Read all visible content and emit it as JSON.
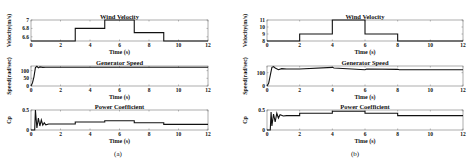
{
  "chart_data": [
    {
      "panel": "(a)",
      "type": "line",
      "subplots": [
        {
          "title": "Wind Velocity",
          "xlabel": "Time (s)",
          "ylabel": "Velocity(m/s)",
          "xlim": [
            0,
            12
          ],
          "ylim": [
            6.5,
            7
          ],
          "yticks": [
            6.6,
            6.8,
            7
          ],
          "xticks": [
            0,
            2,
            4,
            6,
            8,
            10,
            12
          ],
          "x": [
            0,
            3,
            3,
            5,
            5,
            7,
            7,
            9,
            9,
            12
          ],
          "y": [
            6.5,
            6.5,
            6.8,
            6.8,
            7,
            7,
            6.7,
            6.7,
            6.5,
            6.5
          ]
        },
        {
          "title": "Generator Speed",
          "xlabel": "Time (s)",
          "ylabel": "Speed(rad/sec)",
          "xlim": [
            0,
            12
          ],
          "ylim": [
            0,
            130
          ],
          "yticks": [
            0,
            50,
            100
          ],
          "xticks": [
            0,
            2,
            4,
            6,
            8,
            10,
            12
          ],
          "x": [
            0,
            0.1,
            0.2,
            0.3,
            0.4,
            0.5,
            0.6,
            0.8,
            1.0,
            12
          ],
          "y": [
            0,
            20,
            60,
            120,
            128,
            118,
            124,
            121,
            122,
            122
          ]
        },
        {
          "title": "Power Coefficient",
          "xlabel": "Time (s)",
          "ylabel": "Cp",
          "xlim": [
            0,
            12
          ],
          "ylim": [
            0,
            0.5
          ],
          "yticks": [
            0,
            0.5
          ],
          "xticks": [
            0,
            2,
            4,
            6,
            8,
            10,
            12
          ],
          "x": [
            0,
            0.25,
            0.3,
            0.4,
            0.5,
            0.6,
            0.7,
            0.8,
            0.9,
            1.0,
            1.2,
            3,
            3,
            5,
            5,
            7,
            7,
            9,
            9,
            12
          ],
          "y": [
            0,
            0,
            0.5,
            0.05,
            0.3,
            0.1,
            0.25,
            0.12,
            0.18,
            0.13,
            0.15,
            0.15,
            0.2,
            0.2,
            0.23,
            0.23,
            0.18,
            0.18,
            0.14,
            0.14
          ]
        }
      ]
    },
    {
      "panel": "(b)",
      "type": "line",
      "subplots": [
        {
          "title": "Wind Velocity",
          "xlabel": "Time (s)",
          "ylabel": "Velocity(m/s)",
          "xlim": [
            0,
            12
          ],
          "ylim": [
            8,
            11
          ],
          "yticks": [
            8,
            9,
            10,
            11
          ],
          "xticks": [
            0,
            2,
            4,
            6,
            8,
            10,
            12
          ],
          "x": [
            0,
            2,
            2,
            4,
            4,
            6,
            6,
            8,
            8,
            12
          ],
          "y": [
            8,
            8,
            9,
            9,
            11,
            11,
            9,
            9,
            8,
            8
          ]
        },
        {
          "title": "Generator Speed",
          "xlabel": "Time (s)",
          "ylabel": "Speed(rad/sec)",
          "xlim": [
            0,
            12
          ],
          "ylim": [
            0,
            150
          ],
          "yticks": [
            0,
            100
          ],
          "xticks": [
            0,
            2,
            4,
            6,
            8,
            10,
            12
          ],
          "x": [
            0,
            0.1,
            0.2,
            0.3,
            0.4,
            0.5,
            0.7,
            0.9,
            1.2,
            2,
            4,
            4.1,
            6,
            6.1,
            8,
            8.1,
            12
          ],
          "y": [
            0,
            20,
            80,
            140,
            145,
            135,
            122,
            130,
            127,
            127,
            140,
            135,
            122,
            127,
            125,
            122,
            122
          ]
        },
        {
          "title": "Power Coefficient",
          "xlabel": "Time (s)",
          "ylabel": "Cp",
          "xlim": [
            0,
            12
          ],
          "ylim": [
            0,
            0.5
          ],
          "yticks": [
            0,
            0.5
          ],
          "xticks": [
            0,
            2,
            4,
            6,
            8,
            10,
            12
          ],
          "x": [
            0,
            0.2,
            0.25,
            0.3,
            0.4,
            0.5,
            0.6,
            0.7,
            0.8,
            1.0,
            1.2,
            2,
            2,
            4,
            4,
            6,
            6,
            8,
            8,
            12
          ],
          "y": [
            0,
            0,
            0.45,
            0.1,
            0.4,
            0.2,
            0.42,
            0.3,
            0.38,
            0.35,
            0.36,
            0.36,
            0.42,
            0.42,
            0.47,
            0.47,
            0.42,
            0.42,
            0.36,
            0.36
          ]
        }
      ]
    }
  ],
  "captions": {
    "a": "(a)",
    "b": "(b)"
  }
}
